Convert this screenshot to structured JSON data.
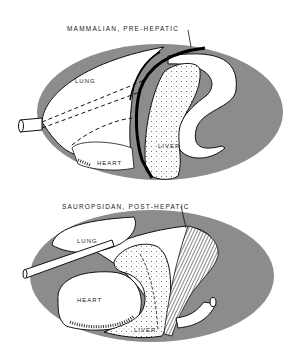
{
  "colors": {
    "body_cavity": "#8c8c8c",
    "organ_fill": "#ffffff",
    "outline": "#111111",
    "septum": "#000000",
    "liver_dots": "#555555"
  },
  "panels": [
    {
      "title": "MAMMALIAN, PRE-HEPATIC",
      "labels": {
        "lung": "LUNG",
        "heart": "HEART",
        "liver": "LIVER"
      }
    },
    {
      "title": "SAUROPSIDAN, POST-HEPATIC",
      "labels": {
        "lung": "LUNG",
        "heart": "HEART",
        "liver": "LIVER"
      }
    }
  ]
}
